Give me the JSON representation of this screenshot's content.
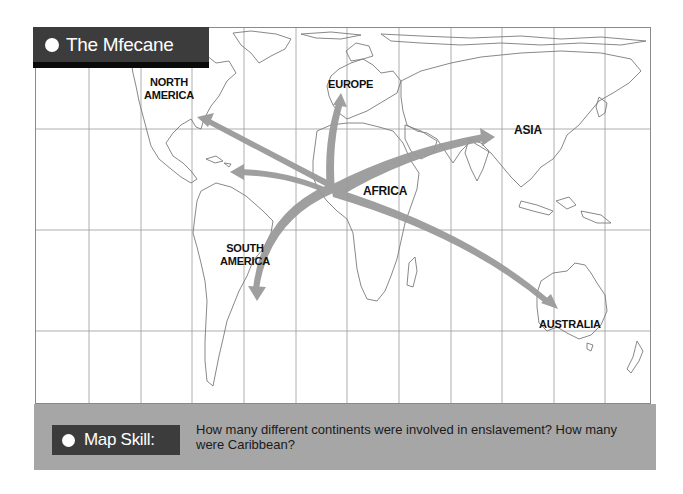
{
  "title": {
    "label": "The Mfecane",
    "icon": "white-dot-bullet"
  },
  "map": {
    "grid": {
      "vertical_lines": 12,
      "horizontal_lines": 3
    },
    "labels": {
      "north_america": "NORTH\nAMERICA",
      "europe": "EUROPE",
      "asia": "ASIA",
      "africa": "AFRICA",
      "south_america": "SOUTH\nAMERICA",
      "australia": "AUSTRALIA"
    },
    "arrows": [
      {
        "from": "africa",
        "to": "north_america"
      },
      {
        "from": "africa",
        "to": "caribbean"
      },
      {
        "from": "africa",
        "to": "europe"
      },
      {
        "from": "africa",
        "to": "asia"
      },
      {
        "from": "africa",
        "to": "south_america"
      },
      {
        "from": "africa",
        "to": "australia"
      }
    ],
    "arrow_color": "#9a9a9a",
    "outline_color": "#7a7a7a"
  },
  "map_skill": {
    "label": "Map Skill:",
    "icon": "white-dot-bullet",
    "question": "How many different continents were involved in enslavement? How many were Caribbean?"
  },
  "colors": {
    "banner": "#3c3c3c",
    "banner_strip": "#0a0a0a",
    "skill_band": "#a6a6a6"
  }
}
